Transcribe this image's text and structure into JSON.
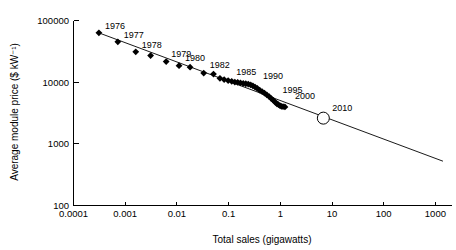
{
  "chart_data": {
    "type": "scatter",
    "title": "",
    "subtitle": "",
    "xlabel": "Total sales (gigawatts)",
    "ylabel": "Average module price ($ kW⁻¹)",
    "xscale": "log",
    "yscale": "log",
    "xlim": [
      0.0001,
      1000
    ],
    "ylim": [
      100,
      100000
    ],
    "grid": false,
    "legend": null,
    "xticks": [
      "0.0001",
      "0.001",
      "0.01",
      "0.1",
      "1",
      "10",
      "100",
      "1000"
    ],
    "xtick_values": [
      0.0001,
      0.001,
      0.01,
      0.1,
      1,
      10,
      100,
      1000
    ],
    "yticks": [
      "100",
      "1000",
      "10000",
      "100000"
    ],
    "ytick_values": [
      100,
      1000,
      10000,
      100000
    ],
    "series": [
      {
        "name": "Historical module price vs cumulative sales",
        "marker": "filled-diamond",
        "points": [
          {
            "x": 0.00031,
            "y": 63000,
            "label": "1976"
          },
          {
            "x": 0.00072,
            "y": 45000,
            "label": "1977"
          },
          {
            "x": 0.0016,
            "y": 31000,
            "label": "1978"
          },
          {
            "x": 0.0031,
            "y": 27000,
            "label": "1979"
          },
          {
            "x": 0.0062,
            "y": 21500,
            "label": ""
          },
          {
            "x": 0.011,
            "y": 18500,
            "label": "1980"
          },
          {
            "x": 0.018,
            "y": 17500,
            "label": ""
          },
          {
            "x": 0.033,
            "y": 14000,
            "label": "1982"
          },
          {
            "x": 0.051,
            "y": 13500,
            "label": ""
          },
          {
            "x": 0.068,
            "y": 11500,
            "label": ""
          },
          {
            "x": 0.082,
            "y": 11000,
            "label": ""
          },
          {
            "x": 0.098,
            "y": 10600,
            "label": "1985"
          },
          {
            "x": 0.115,
            "y": 10300,
            "label": ""
          },
          {
            "x": 0.132,
            "y": 10000,
            "label": ""
          },
          {
            "x": 0.15,
            "y": 9900,
            "label": ""
          },
          {
            "x": 0.17,
            "y": 9700,
            "label": ""
          },
          {
            "x": 0.192,
            "y": 9500,
            "label": ""
          },
          {
            "x": 0.215,
            "y": 9400,
            "label": ""
          },
          {
            "x": 0.24,
            "y": 9300,
            "label": ""
          },
          {
            "x": 0.268,
            "y": 9000,
            "label": ""
          },
          {
            "x": 0.295,
            "y": 8700,
            "label": "1990"
          },
          {
            "x": 0.325,
            "y": 8300,
            "label": ""
          },
          {
            "x": 0.36,
            "y": 7900,
            "label": ""
          },
          {
            "x": 0.4,
            "y": 7400,
            "label": ""
          },
          {
            "x": 0.445,
            "y": 7000,
            "label": ""
          },
          {
            "x": 0.495,
            "y": 6600,
            "label": ""
          },
          {
            "x": 0.55,
            "y": 6200,
            "label": ""
          },
          {
            "x": 0.61,
            "y": 5800,
            "label": ""
          },
          {
            "x": 0.67,
            "y": 5400,
            "label": ""
          },
          {
            "x": 0.735,
            "y": 5050,
            "label": "1995"
          },
          {
            "x": 0.8,
            "y": 4700,
            "label": ""
          },
          {
            "x": 0.86,
            "y": 4450,
            "label": ""
          },
          {
            "x": 0.92,
            "y": 4300,
            "label": ""
          },
          {
            "x": 0.985,
            "y": 4150,
            "label": ""
          },
          {
            "x": 1.05,
            "y": 4050,
            "label": ""
          },
          {
            "x": 1.13,
            "y": 4000,
            "label": ""
          },
          {
            "x": 1.23,
            "y": 3950,
            "label": "2000"
          }
        ]
      },
      {
        "name": "Projected 2010 point",
        "marker": "open-circle",
        "points": [
          {
            "x": 6.8,
            "y": 2600,
            "label": "2010"
          }
        ]
      }
    ],
    "trend_line": {
      "name": "experience-curve fit",
      "from": {
        "x": 0.00031,
        "y": 63000
      },
      "to": {
        "x": 1400,
        "y": 520
      }
    },
    "annotations": [
      {
        "text": "1976",
        "x": 0.00031,
        "y": 63000
      },
      {
        "text": "1977",
        "x": 0.00072,
        "y": 45000
      },
      {
        "text": "1978",
        "x": 0.0016,
        "y": 31000
      },
      {
        "text": "1979",
        "x": 0.0062,
        "y": 21500
      },
      {
        "text": "1980",
        "x": 0.011,
        "y": 18500
      },
      {
        "text": "1982",
        "x": 0.033,
        "y": 14000
      },
      {
        "text": "1985",
        "x": 0.098,
        "y": 10600
      },
      {
        "text": "1990",
        "x": 0.295,
        "y": 8700
      },
      {
        "text": "1995",
        "x": 0.735,
        "y": 5050
      },
      {
        "text": "2000",
        "x": 1.23,
        "y": 3950
      },
      {
        "text": "2010",
        "x": 6.8,
        "y": 2600
      }
    ]
  }
}
